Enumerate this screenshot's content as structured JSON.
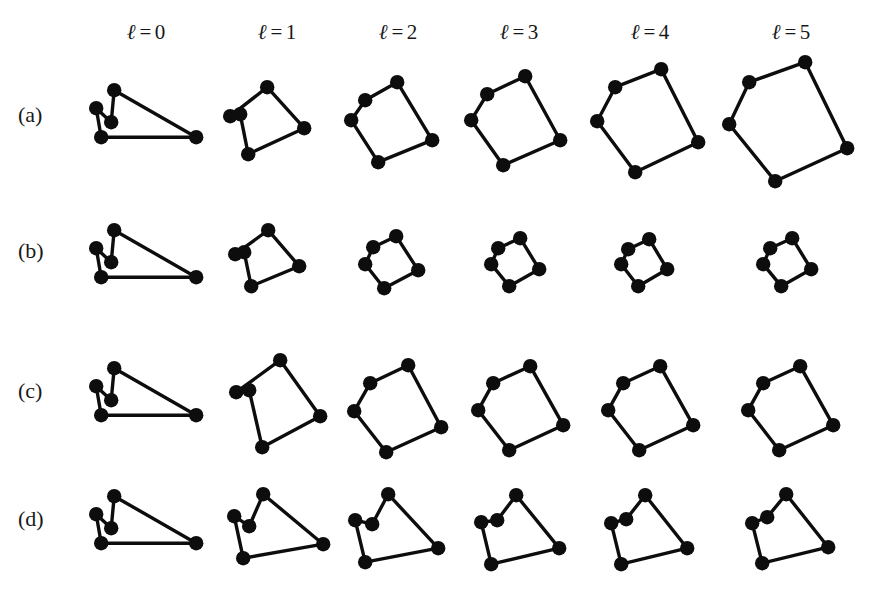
{
  "figure": {
    "background_color": "#ffffff",
    "ink_color": "#0d0d0d",
    "width": 889,
    "height": 589
  },
  "columns": [
    {
      "id": "l0",
      "symbol": "ℓ",
      "equals": "=",
      "value": "0",
      "label": "ℓ = 0",
      "center_x": 146
    },
    {
      "id": "l1",
      "symbol": "ℓ",
      "equals": "=",
      "value": "1",
      "label": "ℓ = 1",
      "center_x": 277
    },
    {
      "id": "l2",
      "symbol": "ℓ",
      "equals": "=",
      "value": "2",
      "label": "ℓ = 2",
      "center_x": 398
    },
    {
      "id": "l3",
      "symbol": "ℓ",
      "equals": "=",
      "value": "3",
      "label": "ℓ = 3",
      "center_x": 519
    },
    {
      "id": "l4",
      "symbol": "ℓ",
      "equals": "=",
      "value": "4",
      "label": "ℓ = 4",
      "center_x": 650
    },
    {
      "id": "l5",
      "symbol": "ℓ",
      "equals": "=",
      "value": "5",
      "label": "ℓ = 5",
      "center_x": 791
    }
  ],
  "rows": [
    {
      "id": "a",
      "label": "(a)",
      "label_x": 18,
      "label_y": 104
    },
    {
      "id": "b",
      "label": "(b)",
      "label_x": 18,
      "label_y": 240
    },
    {
      "id": "c",
      "label": "(c)",
      "label_x": 18,
      "label_y": 380
    },
    {
      "id": "d",
      "label": "(d)",
      "label_x": 18,
      "label_y": 508
    }
  ],
  "chart_data": {
    "type": "diagram",
    "title": "",
    "node_count_per_panel": 5,
    "edge_count_per_panel": 5,
    "node_radius": 7.2,
    "edge_width": 3.4,
    "panels": [
      {
        "row": "a",
        "column": "l0",
        "x": 84,
        "y": 80,
        "w": 125,
        "h": 84,
        "nodes": [
          [
            30,
            10
          ],
          [
            12,
            28
          ],
          [
            27,
            42
          ],
          [
            17,
            57
          ],
          [
            112,
            57
          ]
        ],
        "edges": [
          [
            0,
            2
          ],
          [
            2,
            1
          ],
          [
            1,
            3
          ],
          [
            3,
            4
          ],
          [
            4,
            0
          ]
        ]
      },
      {
        "row": "a",
        "column": "l1",
        "x": 222,
        "y": 78,
        "w": 100,
        "h": 90,
        "nodes": [
          [
            45,
            9
          ],
          [
            18,
            36
          ],
          [
            8,
            38
          ],
          [
            26,
            76
          ],
          [
            82,
            50
          ]
        ],
        "edges": [
          [
            0,
            2
          ],
          [
            2,
            1
          ],
          [
            1,
            3
          ],
          [
            3,
            4
          ],
          [
            4,
            0
          ]
        ]
      },
      {
        "row": "a",
        "column": "l2",
        "x": 343,
        "y": 70,
        "w": 102,
        "h": 100,
        "nodes": [
          [
            54,
            12
          ],
          [
            22,
            30
          ],
          [
            8,
            50
          ],
          [
            35,
            92
          ],
          [
            89,
            70
          ]
        ],
        "edges": [
          [
            0,
            1
          ],
          [
            1,
            2
          ],
          [
            2,
            3
          ],
          [
            3,
            4
          ],
          [
            4,
            0
          ]
        ]
      },
      {
        "row": "a",
        "column": "l3",
        "x": 463,
        "y": 64,
        "w": 110,
        "h": 110,
        "nodes": [
          [
            62,
            12
          ],
          [
            24,
            30
          ],
          [
            8,
            56
          ],
          [
            40,
            101
          ],
          [
            97,
            76
          ]
        ],
        "edges": [
          [
            0,
            1
          ],
          [
            1,
            2
          ],
          [
            2,
            3
          ],
          [
            3,
            4
          ],
          [
            4,
            0
          ]
        ]
      },
      {
        "row": "a",
        "column": "l4",
        "x": 589,
        "y": 57,
        "w": 122,
        "h": 124,
        "nodes": [
          [
            72,
            12
          ],
          [
            26,
            30
          ],
          [
            8,
            64
          ],
          [
            46,
            115
          ],
          [
            109,
            85
          ]
        ],
        "edges": [
          [
            0,
            1
          ],
          [
            1,
            2
          ],
          [
            2,
            3
          ],
          [
            3,
            4
          ],
          [
            4,
            0
          ]
        ]
      },
      {
        "row": "a",
        "column": "l5",
        "x": 721,
        "y": 50,
        "w": 140,
        "h": 140,
        "nodes": [
          [
            84,
            12
          ],
          [
            28,
            32
          ],
          [
            8,
            74
          ],
          [
            54,
            131
          ],
          [
            126,
            98
          ]
        ],
        "edges": [
          [
            0,
            1
          ],
          [
            1,
            2
          ],
          [
            2,
            3
          ],
          [
            3,
            4
          ],
          [
            4,
            0
          ]
        ]
      },
      {
        "row": "b",
        "column": "l0",
        "x": 84,
        "y": 220,
        "w": 125,
        "h": 84,
        "nodes": [
          [
            30,
            10
          ],
          [
            12,
            28
          ],
          [
            27,
            42
          ],
          [
            17,
            57
          ],
          [
            112,
            57
          ]
        ],
        "edges": [
          [
            0,
            2
          ],
          [
            2,
            1
          ],
          [
            1,
            3
          ],
          [
            3,
            4
          ],
          [
            4,
            0
          ]
        ]
      },
      {
        "row": "b",
        "column": "l1",
        "x": 228,
        "y": 222,
        "w": 84,
        "h": 76,
        "nodes": [
          [
            40,
            8
          ],
          [
            16,
            30
          ],
          [
            7,
            32
          ],
          [
            23,
            64
          ],
          [
            71,
            44
          ]
        ],
        "edges": [
          [
            0,
            2
          ],
          [
            2,
            1
          ],
          [
            1,
            3
          ],
          [
            3,
            4
          ],
          [
            4,
            0
          ]
        ]
      },
      {
        "row": "b",
        "column": "l2",
        "x": 358,
        "y": 228,
        "w": 68,
        "h": 66,
        "nodes": [
          [
            38,
            8
          ],
          [
            15,
            19
          ],
          [
            7,
            36
          ],
          [
            26,
            60
          ],
          [
            60,
            42
          ]
        ],
        "edges": [
          [
            0,
            1
          ],
          [
            1,
            2
          ],
          [
            2,
            3
          ],
          [
            3,
            4
          ],
          [
            4,
            0
          ]
        ]
      },
      {
        "row": "b",
        "column": "l3",
        "x": 484,
        "y": 230,
        "w": 62,
        "h": 62,
        "nodes": [
          [
            36,
            8
          ],
          [
            14,
            18
          ],
          [
            7,
            34
          ],
          [
            25,
            56
          ],
          [
            55,
            39
          ]
        ],
        "edges": [
          [
            0,
            1
          ],
          [
            1,
            2
          ],
          [
            2,
            3
          ],
          [
            3,
            4
          ],
          [
            4,
            0
          ]
        ]
      },
      {
        "row": "b",
        "column": "l4",
        "x": 614,
        "y": 231,
        "w": 60,
        "h": 60,
        "nodes": [
          [
            35,
            8
          ],
          [
            14,
            18
          ],
          [
            7,
            33
          ],
          [
            24,
            55
          ],
          [
            53,
            38
          ]
        ],
        "edges": [
          [
            0,
            1
          ],
          [
            1,
            2
          ],
          [
            2,
            3
          ],
          [
            3,
            4
          ],
          [
            4,
            0
          ]
        ]
      },
      {
        "row": "b",
        "column": "l5",
        "x": 756,
        "y": 230,
        "w": 62,
        "h": 62,
        "nodes": [
          [
            36,
            8
          ],
          [
            14,
            18
          ],
          [
            7,
            34
          ],
          [
            25,
            56
          ],
          [
            55,
            39
          ]
        ],
        "edges": [
          [
            0,
            1
          ],
          [
            1,
            2
          ],
          [
            2,
            3
          ],
          [
            3,
            4
          ],
          [
            4,
            0
          ]
        ]
      },
      {
        "row": "c",
        "column": "l0",
        "x": 84,
        "y": 358,
        "w": 125,
        "h": 84,
        "nodes": [
          [
            30,
            10
          ],
          [
            12,
            28
          ],
          [
            27,
            42
          ],
          [
            17,
            57
          ],
          [
            112,
            57
          ]
        ],
        "edges": [
          [
            0,
            2
          ],
          [
            2,
            1
          ],
          [
            1,
            3
          ],
          [
            3,
            4
          ],
          [
            4,
            0
          ]
        ]
      },
      {
        "row": "c",
        "column": "l1",
        "x": 222,
        "y": 352,
        "w": 112,
        "h": 104,
        "nodes": [
          [
            58,
            8
          ],
          [
            27,
            38
          ],
          [
            14,
            40
          ],
          [
            40,
            95
          ],
          [
            98,
            64
          ]
        ],
        "edges": [
          [
            0,
            2
          ],
          [
            2,
            1
          ],
          [
            1,
            3
          ],
          [
            3,
            4
          ],
          [
            4,
            0
          ]
        ]
      },
      {
        "row": "c",
        "column": "l2",
        "x": 346,
        "y": 355,
        "w": 106,
        "h": 104,
        "nodes": [
          [
            62,
            10
          ],
          [
            24,
            28
          ],
          [
            8,
            56
          ],
          [
            40,
            97
          ],
          [
            95,
            72
          ]
        ],
        "edges": [
          [
            0,
            1
          ],
          [
            1,
            2
          ],
          [
            2,
            3
          ],
          [
            3,
            4
          ],
          [
            4,
            0
          ]
        ]
      },
      {
        "row": "c",
        "column": "l3",
        "x": 470,
        "y": 356,
        "w": 104,
        "h": 100,
        "nodes": [
          [
            60,
            10
          ],
          [
            23,
            27
          ],
          [
            8,
            54
          ],
          [
            39,
            94
          ],
          [
            93,
            69
          ]
        ],
        "edges": [
          [
            0,
            1
          ],
          [
            1,
            2
          ],
          [
            2,
            3
          ],
          [
            3,
            4
          ],
          [
            4,
            0
          ]
        ]
      },
      {
        "row": "c",
        "column": "l4",
        "x": 600,
        "y": 356,
        "w": 104,
        "h": 100,
        "nodes": [
          [
            60,
            10
          ],
          [
            23,
            27
          ],
          [
            8,
            54
          ],
          [
            39,
            94
          ],
          [
            93,
            69
          ]
        ],
        "edges": [
          [
            0,
            1
          ],
          [
            1,
            2
          ],
          [
            2,
            3
          ],
          [
            3,
            4
          ],
          [
            4,
            0
          ]
        ]
      },
      {
        "row": "c",
        "column": "l5",
        "x": 740,
        "y": 356,
        "w": 104,
        "h": 100,
        "nodes": [
          [
            60,
            10
          ],
          [
            23,
            27
          ],
          [
            8,
            54
          ],
          [
            39,
            94
          ],
          [
            93,
            69
          ]
        ],
        "edges": [
          [
            0,
            1
          ],
          [
            1,
            2
          ],
          [
            2,
            3
          ],
          [
            3,
            4
          ],
          [
            4,
            0
          ]
        ]
      },
      {
        "row": "d",
        "column": "l0",
        "x": 84,
        "y": 486,
        "w": 125,
        "h": 84,
        "nodes": [
          [
            30,
            10
          ],
          [
            12,
            28
          ],
          [
            27,
            42
          ],
          [
            17,
            57
          ],
          [
            112,
            57
          ]
        ],
        "edges": [
          [
            0,
            2
          ],
          [
            2,
            1
          ],
          [
            1,
            3
          ],
          [
            3,
            4
          ],
          [
            4,
            0
          ]
        ]
      },
      {
        "row": "d",
        "column": "l1",
        "x": 222,
        "y": 486,
        "w": 113,
        "h": 84,
        "nodes": [
          [
            41,
            8
          ],
          [
            12,
            30
          ],
          [
            27,
            40
          ],
          [
            21,
            72
          ],
          [
            101,
            58
          ]
        ],
        "edges": [
          [
            0,
            2
          ],
          [
            2,
            1
          ],
          [
            1,
            3
          ],
          [
            3,
            4
          ],
          [
            4,
            0
          ]
        ]
      },
      {
        "row": "d",
        "column": "l2",
        "x": 343,
        "y": 486,
        "w": 108,
        "h": 86,
        "nodes": [
          [
            45,
            8
          ],
          [
            12,
            34
          ],
          [
            29,
            38
          ],
          [
            22,
            76
          ],
          [
            95,
            62
          ]
        ],
        "edges": [
          [
            0,
            2
          ],
          [
            2,
            1
          ],
          [
            1,
            3
          ],
          [
            3,
            4
          ],
          [
            4,
            0
          ]
        ]
      },
      {
        "row": "d",
        "column": "l3",
        "x": 471,
        "y": 488,
        "w": 100,
        "h": 84,
        "nodes": [
          [
            45,
            7
          ],
          [
            10,
            34
          ],
          [
            26,
            32
          ],
          [
            20,
            76
          ],
          [
            88,
            60
          ]
        ],
        "edges": [
          [
            0,
            2
          ],
          [
            2,
            1
          ],
          [
            1,
            3
          ],
          [
            3,
            4
          ],
          [
            4,
            0
          ]
        ]
      },
      {
        "row": "d",
        "column": "l4",
        "x": 601,
        "y": 488,
        "w": 98,
        "h": 84,
        "nodes": [
          [
            44,
            7
          ],
          [
            10,
            35
          ],
          [
            25,
            31
          ],
          [
            20,
            76
          ],
          [
            86,
            60
          ]
        ],
        "edges": [
          [
            0,
            2
          ],
          [
            2,
            1
          ],
          [
            1,
            3
          ],
          [
            3,
            4
          ],
          [
            4,
            0
          ]
        ]
      },
      {
        "row": "d",
        "column": "l5",
        "x": 742,
        "y": 487,
        "w": 98,
        "h": 84,
        "nodes": [
          [
            44,
            7
          ],
          [
            10,
            36
          ],
          [
            25,
            30
          ],
          [
            20,
            76
          ],
          [
            86,
            60
          ]
        ],
        "edges": [
          [
            0,
            2
          ],
          [
            2,
            1
          ],
          [
            1,
            3
          ],
          [
            3,
            4
          ],
          [
            4,
            0
          ]
        ]
      }
    ]
  }
}
